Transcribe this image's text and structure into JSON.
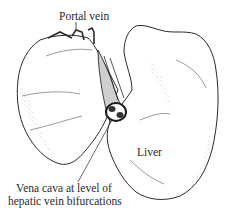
{
  "figure": {
    "labels": {
      "portal_vein": "Portal vein",
      "liver": "Liver",
      "vena_cava_line1": "Vena cava at level of",
      "vena_cava_line2": "hepatic vein bifurcations"
    },
    "colors": {
      "ink": "#2a2a2a",
      "background": "#ffffff"
    }
  }
}
